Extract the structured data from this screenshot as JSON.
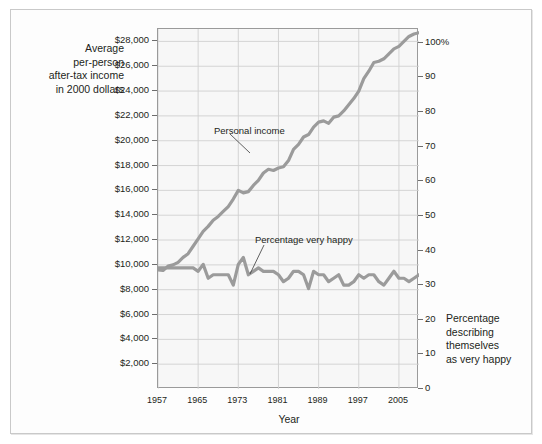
{
  "figure": {
    "background_color": "#ffffff",
    "frame_color": "#c9c9c9",
    "plot_background_color": "#f7f7f7",
    "grid_color": "#d0d0d0",
    "axis_color": "#9a9a9a",
    "series_color": "#9b9b9b",
    "text_color": "#231f20"
  },
  "axes": {
    "left_title": {
      "line1": "Average",
      "line2": "per-person",
      "line3": "after-tax income",
      "line4": "in 2000 dollars"
    },
    "right_title": {
      "line1": "Percentage",
      "line2": "describing",
      "line3": "themselves",
      "line4": "as very happy"
    },
    "x_title": "Year",
    "left_ticks": [
      "$28,000",
      "$26,000",
      "$24,000",
      "$22,000",
      "$20,000",
      "$18,000",
      "$16,000",
      "$14,000",
      "$12,000",
      "$10,000",
      "$8,000",
      "$6,000",
      "$4,000",
      "$2,000"
    ],
    "right_ticks": [
      "100%",
      "90",
      "80",
      "70",
      "60",
      "50",
      "40",
      "30",
      "20",
      "10",
      "0"
    ],
    "x_ticks": [
      "1957",
      "1965",
      "1973",
      "1981",
      "1989",
      "1997",
      "2005"
    ]
  },
  "annotations": {
    "personal_income": "Personal income",
    "very_happy": "Percentage very happy"
  },
  "chart_data": {
    "type": "line",
    "title": "",
    "subtitle": "",
    "xlabel": "Year",
    "ylabel": "Average per-person after-tax income in 2000 dollars",
    "y2label": "Percentage describing themselves as very happy",
    "xlim": [
      1957,
      2009
    ],
    "ylim": [
      0,
      29000
    ],
    "y2lim": [
      0,
      104
    ],
    "grid": true,
    "legend_position": "inline-annotations",
    "x_tick_values": [
      1957,
      1965,
      1973,
      1981,
      1989,
      1997,
      2005
    ],
    "y_tick_values": [
      2000,
      4000,
      6000,
      8000,
      10000,
      12000,
      14000,
      16000,
      18000,
      20000,
      22000,
      24000,
      26000,
      28000
    ],
    "y2_tick_values": [
      0,
      10,
      20,
      30,
      40,
      50,
      60,
      70,
      80,
      90,
      100
    ],
    "x": [
      1957,
      1958,
      1959,
      1960,
      1961,
      1962,
      1963,
      1964,
      1965,
      1966,
      1967,
      1968,
      1969,
      1970,
      1971,
      1972,
      1973,
      1974,
      1975,
      1976,
      1977,
      1978,
      1979,
      1980,
      1981,
      1982,
      1983,
      1984,
      1985,
      1986,
      1987,
      1988,
      1989,
      1990,
      1991,
      1992,
      1993,
      1994,
      1995,
      1996,
      1997,
      1998,
      1999,
      2000,
      2001,
      2002,
      2003,
      2004,
      2005,
      2006,
      2007,
      2008,
      2009
    ],
    "series": [
      {
        "name": "Personal income",
        "axis": "left",
        "unit": "2000 dollars",
        "values": [
          9600,
          9550,
          9900,
          10000,
          10200,
          10600,
          10900,
          11500,
          12100,
          12700,
          13100,
          13600,
          13900,
          14300,
          14700,
          15300,
          16000,
          15800,
          15900,
          16400,
          16800,
          17400,
          17700,
          17600,
          17800,
          17900,
          18400,
          19300,
          19700,
          20300,
          20500,
          21100,
          21500,
          21600,
          21400,
          21900,
          22000,
          22400,
          22900,
          23400,
          24000,
          25000,
          25600,
          26300,
          26400,
          26600,
          27000,
          27400,
          27600,
          28000,
          28400,
          28600,
          28700
        ]
      },
      {
        "name": "Percentage very happy",
        "axis": "right",
        "unit": "percent",
        "values": [
          35,
          35,
          35,
          35,
          35,
          35,
          35,
          35,
          34,
          36,
          32,
          33,
          33,
          33,
          33,
          30,
          36,
          38,
          33,
          34,
          35,
          34,
          34,
          34,
          33,
          31,
          32,
          34,
          34,
          33,
          29,
          34,
          33,
          33,
          31,
          32,
          33,
          30,
          30,
          31,
          33,
          32,
          33,
          33,
          31,
          30,
          32,
          34,
          32,
          32,
          31,
          32,
          33
        ]
      }
    ]
  }
}
